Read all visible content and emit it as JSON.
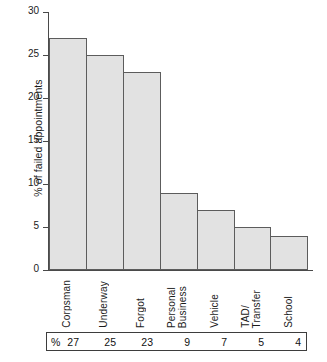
{
  "chart_data": {
    "type": "bar",
    "title": "",
    "subtitle": "",
    "xlabel": "",
    "ylabel": "% of failed appointments",
    "ylim": [
      0,
      30
    ],
    "yticks": [
      0,
      5,
      10,
      15,
      20,
      25,
      30
    ],
    "ytick_labels": [
      "0",
      "5",
      "10",
      "15",
      "20",
      "25",
      "30"
    ],
    "grid": false,
    "legend": null,
    "categories": [
      "Corpsman",
      "Underway",
      "Forgot",
      "Personal Business",
      "Vehicle",
      "TAD/Transfer",
      "School"
    ],
    "category_label_lines": [
      [
        "Corpsman"
      ],
      [
        "Underway"
      ],
      [
        "Forgot"
      ],
      [
        "Personal",
        "Business"
      ],
      [
        "Vehicle"
      ],
      [
        "TAD/",
        "Transfer"
      ],
      [
        "School"
      ]
    ],
    "values": [
      27,
      25,
      23,
      9,
      7,
      5,
      4
    ],
    "bar_fill_color": "#e2e2e2",
    "bar_edge_color": "#5c5c5c",
    "axis_color": "#4a4a4a"
  },
  "value_table": {
    "percent_symbol": "%",
    "values": [
      "27",
      "25",
      "23",
      "9",
      "7",
      "5",
      "4"
    ]
  }
}
